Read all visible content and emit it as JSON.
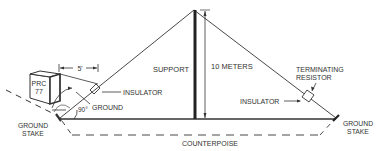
{
  "diagram": {
    "type": "antenna installation diagram (sloping half-rhombic / long-wire)",
    "labels": {
      "radio_line1": "PRC",
      "radio_line2": "77",
      "distance": "5'",
      "insulator_left": "INSULATOR",
      "ground": "GROUND",
      "angle": "90°",
      "ground_stake_left_line1": "GROUND",
      "ground_stake_left_line2": "STAKE",
      "support": "SUPPORT",
      "height": "10 METERS",
      "terminating_resistor_line1": "TERMINATING",
      "terminating_resistor_line2": "RESISTOR",
      "insulator_right": "INSULATOR",
      "ground_stake_right_line1": "GROUND",
      "ground_stake_right_line2": "STAKE",
      "counterpoise": "COUNTERPOISE"
    },
    "colors": {
      "line": "#333333",
      "background": "#ffffff"
    }
  }
}
